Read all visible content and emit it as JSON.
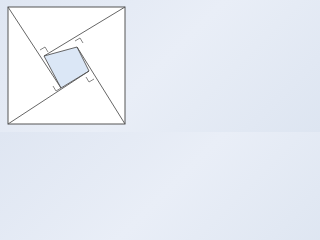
{
  "diagram": {
    "type": "geometric-figure",
    "colors": {
      "background": "#e4eaf4",
      "outer_square_fill": "#ffffff",
      "stroke": "#555555",
      "inner_square_fill": "#dbe7f6",
      "right_angle_marker_stroke": "#666666"
    },
    "outer_square": {
      "x1": 8,
      "y1": 7,
      "x2": 125,
      "y2": 124
    },
    "inner_square": {
      "points": [
        [
          77,
          47
        ],
        [
          89,
          71
        ],
        [
          61,
          88
        ],
        [
          44,
          56
        ]
      ]
    },
    "segments": [
      {
        "from": [
          8,
          7
        ],
        "to": [
          61,
          88
        ]
      },
      {
        "from": [
          125,
          7
        ],
        "to": [
          44,
          56
        ]
      },
      {
        "from": [
          125,
          124
        ],
        "to": [
          77,
          47
        ]
      },
      {
        "from": [
          8,
          124
        ],
        "to": [
          89,
          71
        ]
      }
    ],
    "right_angle_markers": 4
  }
}
